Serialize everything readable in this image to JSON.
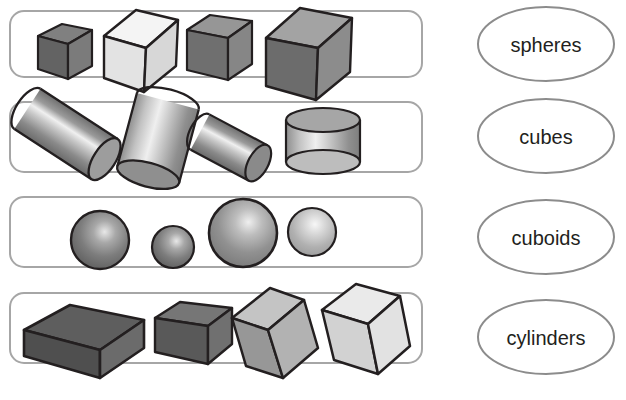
{
  "page": {
    "background_color": "#ffffff",
    "width": 626,
    "height": 400
  },
  "style": {
    "box_stroke": "#a6a6a6",
    "ellipse_stroke": "#8c8c8c",
    "outline": "#231f20",
    "text_color": "#231f20"
  },
  "groups": [
    {
      "id": "group-cubes",
      "shape_kind": "cube",
      "count": 4,
      "box": {
        "x": 10,
        "y": 11,
        "w": 412,
        "h": 66,
        "r": 14
      },
      "items": [
        {
          "name": "cube-small-dark",
          "size": "small",
          "tone": "dark",
          "top_color": "#808080",
          "left_color": "#595959",
          "right_color": "#737373"
        },
        {
          "name": "cube-large-white",
          "size": "large",
          "tone": "white",
          "top_color": "#f2f2f2",
          "left_color": "#e0e0e0",
          "right_color": "#d9d9d9"
        },
        {
          "name": "cube-medium-gray",
          "size": "medium",
          "tone": "gray",
          "top_color": "#949494",
          "left_color": "#6e6e6e",
          "right_color": "#858585"
        },
        {
          "name": "cube-xlarge-gray",
          "size": "x-large",
          "tone": "gray",
          "top_color": "#a1a1a1",
          "left_color": "#6b6b6b",
          "right_color": "#8a8a8a"
        }
      ]
    },
    {
      "id": "group-cylinders",
      "shape_kind": "cylinder",
      "count": 4,
      "box": {
        "x": 10,
        "y": 102,
        "w": 412,
        "h": 70,
        "r": 14
      },
      "items": [
        {
          "name": "cylinder-tilted-left",
          "orientation": "tilted-right-down",
          "size": "large"
        },
        {
          "name": "cylinder-tilted-upright",
          "orientation": "tilted-left",
          "size": "large"
        },
        {
          "name": "cylinder-tilted-short",
          "orientation": "tilted-right-down",
          "size": "small"
        },
        {
          "name": "cylinder-upright-wide",
          "orientation": "upright",
          "size": "wide-short"
        }
      ]
    },
    {
      "id": "group-spheres",
      "shape_kind": "sphere",
      "count": 4,
      "box": {
        "x": 10,
        "y": 197,
        "w": 412,
        "h": 70,
        "r": 14
      },
      "items": [
        {
          "name": "sphere-large-dark",
          "cx": 100,
          "cy": 240,
          "r": 29,
          "tone": "dark"
        },
        {
          "name": "sphere-small-dark",
          "cx": 173,
          "cy": 247,
          "r": 21,
          "tone": "dark"
        },
        {
          "name": "sphere-xlarge-gray",
          "cx": 243,
          "cy": 233,
          "r": 34,
          "tone": "gray"
        },
        {
          "name": "sphere-medium-light",
          "cx": 312,
          "cy": 232,
          "r": 24,
          "tone": "light"
        }
      ]
    },
    {
      "id": "group-cuboids",
      "shape_kind": "cuboid",
      "count": 4,
      "box": {
        "x": 10,
        "y": 293,
        "w": 412,
        "h": 70,
        "r": 14
      },
      "items": [
        {
          "name": "cuboid-large-dark",
          "tone": "dark",
          "orientation": "flat-wide"
        },
        {
          "name": "cuboid-medium-dark",
          "tone": "dark",
          "orientation": "flat-short"
        },
        {
          "name": "cuboid-tall-gray",
          "tone": "gray",
          "orientation": "tilted-upright"
        },
        {
          "name": "cuboid-tall-light",
          "tone": "light",
          "orientation": "tilted-upright"
        }
      ]
    }
  ],
  "labels": [
    {
      "id": "label-spheres",
      "text": "spheres",
      "cx": 546,
      "cy": 44,
      "rx": 68,
      "ry": 37
    },
    {
      "id": "label-cubes",
      "text": "cubes",
      "cx": 546,
      "cy": 136,
      "rx": 68,
      "ry": 37
    },
    {
      "id": "label-cuboids",
      "text": "cuboids",
      "cx": 546,
      "cy": 237,
      "rx": 68,
      "ry": 37
    },
    {
      "id": "label-cylinders",
      "text": "cylinders",
      "cx": 546,
      "cy": 337,
      "rx": 68,
      "ry": 37
    }
  ]
}
